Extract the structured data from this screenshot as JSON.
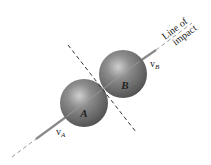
{
  "diagram": {
    "title_label": "Line of impact",
    "title_line1": "Line of",
    "title_line2": "impact",
    "sphere_a_label": "A",
    "sphere_b_label": "B",
    "velocity_a_label": "v",
    "velocity_a_sub": "A",
    "velocity_b_label": "v",
    "velocity_b_sub": "B",
    "colors": {
      "sphere": "#7a7a7a",
      "sphere_highlight": "#c8c8c8",
      "sphere_shadow": "#4a4a4a",
      "line_of_impact": "#8a8a8a",
      "dashed_line": "#333333",
      "background": "#ffffff"
    }
  }
}
